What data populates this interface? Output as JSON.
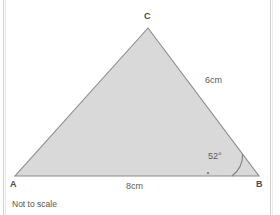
{
  "figure": {
    "type": "triangle-diagram",
    "caption": "Not to scale",
    "fill_color": "#d9d9d9",
    "stroke_color": "#8a8a8a",
    "text_color": "#5a5a5a",
    "background_color": "#ffffff",
    "vertices": [
      {
        "name": "A",
        "label": "A",
        "x": 15,
        "y": 176
      },
      {
        "name": "B",
        "label": "B",
        "x": 259,
        "y": 176
      },
      {
        "name": "C",
        "label": "C",
        "x": 148,
        "y": 28
      }
    ],
    "sides": [
      {
        "name": "side-ab",
        "label": "8cm",
        "value": 8,
        "unit": "cm",
        "from": "A",
        "to": "B"
      },
      {
        "name": "side-cb",
        "label": "6cm",
        "value": 6,
        "unit": "cm",
        "from": "C",
        "to": "B"
      }
    ],
    "angles": [
      {
        "name": "angle-b",
        "label": "52°",
        "value": 52,
        "unit": "degrees",
        "at_vertex": "B"
      }
    ],
    "markers": [
      {
        "name": "base-tick-dot",
        "x": 208,
        "y": 173
      }
    ]
  }
}
